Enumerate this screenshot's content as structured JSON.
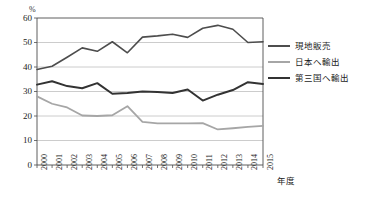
{
  "chart_data": {
    "type": "line",
    "title": "",
    "xlabel": "年度",
    "ylabel": "%",
    "ylim": [
      0,
      60
    ],
    "ytick_step": 10,
    "grid": true,
    "legend_position": "right",
    "categories": [
      "2000",
      "2001",
      "2002",
      "2003",
      "2004",
      "2005",
      "2006",
      "2007",
      "2008",
      "2009",
      "2010",
      "2011",
      "2012",
      "2013",
      "2014",
      "2015"
    ],
    "yticks": [
      "0",
      "10",
      "20",
      "30",
      "40",
      "50",
      "60"
    ],
    "series": [
      {
        "name": "現地販売",
        "color": "#4d4d4d",
        "width": 1.6,
        "values": [
          39.0,
          40.3,
          44.0,
          47.8,
          46.4,
          50.3,
          45.8,
          52.2,
          52.7,
          53.4,
          52.1,
          55.8,
          57.0,
          55.4,
          50.0,
          50.3
        ]
      },
      {
        "name": "日本へ輸出",
        "color": "#a6a6a6",
        "width": 1.8,
        "values": [
          28.0,
          25.0,
          23.5,
          20.2,
          20.0,
          20.3,
          24.0,
          17.6,
          17.0,
          17.0,
          17.0,
          17.1,
          14.5,
          15.0,
          15.6,
          16.0
        ]
      },
      {
        "name": "第三国へ輸出",
        "color": "#333333",
        "width": 2.0,
        "values": [
          32.8,
          34.2,
          32.2,
          31.3,
          33.4,
          29.1,
          29.4,
          30.0,
          29.8,
          29.4,
          30.8,
          26.3,
          28.7,
          30.6,
          33.8,
          33.1
        ]
      }
    ]
  },
  "legend": {
    "items": [
      {
        "label": "現地販売"
      },
      {
        "label": "日本へ輸出"
      },
      {
        "label": "第三国へ輸出"
      }
    ]
  },
  "axes": {
    "y_unit": "%",
    "x_title": "年度"
  },
  "colors": {
    "plot_border": "#4d4d4d",
    "gridline": "#bfbfbf",
    "background": "#ffffff"
  }
}
